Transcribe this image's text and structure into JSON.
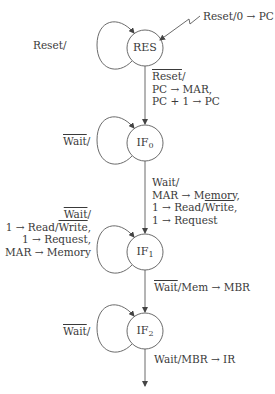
{
  "diagram": {
    "type": "state-machine",
    "colors": {
      "stroke": "#5a5a5a",
      "text": "#3a3a3a",
      "background": "#ffffff"
    },
    "nodes": [
      {
        "id": "RES",
        "label": "RES",
        "sub": ""
      },
      {
        "id": "IF0",
        "label": "IF",
        "sub": "0"
      },
      {
        "id": "IF1",
        "label": "IF",
        "sub": "1"
      },
      {
        "id": "IF2",
        "label": "IF",
        "sub": "2"
      }
    ],
    "initial_transition": {
      "text": "Reset/0 → PC"
    },
    "self_loops": {
      "RES": {
        "text": "Reset/"
      },
      "IF0": {
        "cond": "Wait",
        "cond_overline": true,
        "suffix": "/"
      },
      "IF1": {
        "cond": "Wait",
        "cond_overline": true,
        "suffix": "/",
        "lines": [
          "1 → Read/",
          "Write",
          ",",
          "1 → Request,",
          "MAR → Memory"
        ]
      },
      "IF2": {
        "cond": "Wait",
        "cond_overline": true,
        "suffix": "/"
      }
    },
    "transitions": {
      "RES_IF0": {
        "cond": "Reset",
        "cond_overline": true,
        "suffix": "/",
        "lines": [
          "PC → MAR,",
          "PC + 1 → PC"
        ]
      },
      "IF0_IF1": {
        "cond": "Wait/",
        "line1": "MAR → Memory,",
        "line2_prefix": "1 → Read/",
        "line2_over": "Write",
        "line2_suffix": ",",
        "line3": "1 → Request"
      },
      "IF1_IF2": {
        "cond": "Wait",
        "cond_overline": true,
        "rest": "/Mem → MBR"
      },
      "IF2_out": {
        "text": "Wait/MBR → IR"
      }
    }
  }
}
